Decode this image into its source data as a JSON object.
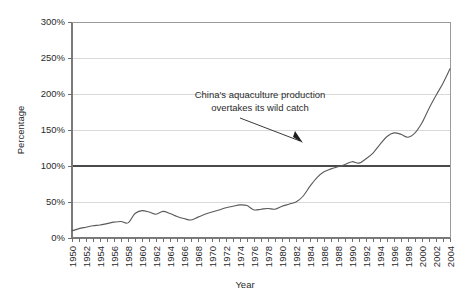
{
  "chart_data": {
    "type": "line",
    "title": "",
    "xlabel": "Year",
    "ylabel": "Percentage",
    "xlim": [
      1950,
      2004
    ],
    "ylim": [
      0,
      300
    ],
    "ytick_step": 50,
    "xtick_step": 2,
    "grid": true,
    "legend": "none",
    "ytick_labels": [
      "0%",
      "50%",
      "100%",
      "150%",
      "200%",
      "250%",
      "300%"
    ],
    "ytick_values": [
      0,
      50,
      100,
      150,
      200,
      250,
      300
    ],
    "xtick_labels": [
      "1950",
      "1951",
      "1952",
      "1953",
      "1954",
      "1955",
      "1956",
      "1957",
      "1958",
      "1959",
      "1960",
      "1961",
      "1962",
      "1963",
      "1964",
      "1965",
      "1966",
      "1967",
      "1968",
      "1969",
      "1970",
      "1971",
      "1972",
      "1973",
      "1974",
      "1975",
      "1976",
      "1977",
      "1978",
      "1979",
      "1980",
      "1981",
      "1982",
      "1983",
      "1984",
      "1985",
      "1986",
      "1987",
      "1988",
      "1989",
      "1990",
      "1991",
      "1992",
      "1993",
      "1994",
      "1995",
      "1996",
      "1997",
      "1998",
      "1999",
      "2000",
      "2001",
      "2002",
      "2003",
      "2004"
    ],
    "xtick_labels_shown": [
      "1950",
      "1952",
      "1954",
      "1956",
      "1958",
      "1960",
      "1962",
      "1964",
      "1966",
      "1968",
      "1970",
      "1972",
      "1974",
      "1976",
      "1978",
      "1980",
      "1982",
      "1984",
      "1986",
      "1988",
      "1990",
      "1992",
      "1994",
      "1996",
      "1998",
      "2000",
      "2002",
      "2004"
    ],
    "series": [
      {
        "name": "China aquaculture as percentage of wild catch",
        "color": "#5a5a5a",
        "x": [
          1950,
          1951,
          1952,
          1953,
          1954,
          1955,
          1956,
          1957,
          1958,
          1959,
          1960,
          1961,
          1962,
          1963,
          1964,
          1965,
          1966,
          1967,
          1968,
          1969,
          1970,
          1971,
          1972,
          1973,
          1974,
          1975,
          1976,
          1977,
          1978,
          1979,
          1980,
          1981,
          1982,
          1983,
          1984,
          1985,
          1986,
          1987,
          1988,
          1989,
          1990,
          1991,
          1992,
          1993,
          1994,
          1995,
          1996,
          1997,
          1998,
          1999,
          2000,
          2001,
          2002,
          2003,
          2004
        ],
        "values": [
          10,
          13,
          15,
          17,
          18,
          20,
          22,
          23,
          21,
          34,
          38,
          36,
          33,
          37,
          34,
          30,
          27,
          25,
          29,
          33,
          36,
          39,
          42,
          44,
          46,
          45,
          39,
          40,
          41,
          40,
          44,
          47,
          50,
          58,
          72,
          84,
          92,
          96,
          99,
          102,
          106,
          104,
          110,
          118,
          130,
          141,
          146,
          144,
          140,
          146,
          160,
          180,
          198,
          215,
          235
        ]
      }
    ],
    "threshold": {
      "value": 100,
      "label": "100%",
      "color": "#4a4a4a"
    },
    "annotations": [
      {
        "name": "china-overtake-annotation",
        "line1": "China's aquaculture production",
        "line2": "overtakes its wild catch",
        "text_x": 1985.0,
        "text_y": 172,
        "arrow_target_x": 1988.5,
        "arrow_target_y": 100
      }
    ]
  }
}
